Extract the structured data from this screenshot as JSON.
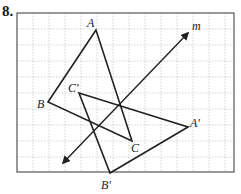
{
  "problem": {
    "number": "8."
  },
  "grid": {
    "left": 17,
    "top": 13,
    "right": 234,
    "bottom": 172,
    "spacing": 16,
    "grid_color": "#c8c8c8",
    "frame_color": "#555555"
  },
  "line_m": {
    "label": "m",
    "start": [
      63,
      163
    ],
    "end": [
      188,
      33
    ],
    "arrows": "both",
    "label_pos": [
      192,
      30
    ]
  },
  "triangle_original": {
    "vertices": [
      {
        "name": "A",
        "x": 96,
        "y": 30,
        "label_x": 87,
        "label_y": 27
      },
      {
        "name": "B",
        "x": 48,
        "y": 102,
        "label_x": 37,
        "label_y": 108
      },
      {
        "name": "C",
        "x": 132,
        "y": 141,
        "label_x": 131,
        "label_y": 152
      }
    ]
  },
  "triangle_image": {
    "vertices": [
      {
        "name": "A'",
        "x": 188,
        "y": 127,
        "label_x": 190,
        "label_y": 127
      },
      {
        "name": "B'",
        "x": 110,
        "y": 173,
        "label_x": 101,
        "label_y": 189
      },
      {
        "name": "C'",
        "x": 79,
        "y": 93,
        "label_x": 68,
        "label_y": 92
      }
    ]
  },
  "stroke_color": "#222222"
}
